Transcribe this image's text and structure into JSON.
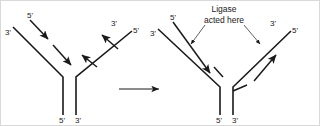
{
  "figure": {
    "background_color": "#ffffff",
    "stroke_color": "#1a1a1a",
    "border_color": "#d9d9d9"
  },
  "annotation": {
    "line1": "Ligase",
    "line2": "acted here"
  },
  "transition_arrow": {
    "direction": "right"
  },
  "left_panel": {
    "name": "before-ligation",
    "labels": {
      "top_left_outer": "3'",
      "top_left_inner": "5'",
      "top_right_inner": "3'",
      "top_right_outer": "5'",
      "stem_left": "5'",
      "stem_right": "3'"
    },
    "fragments": {
      "left_arm": 2,
      "right_arm": 2,
      "continuous": false
    }
  },
  "right_panel": {
    "name": "after-ligation",
    "labels": {
      "top_left_outer": "3'",
      "top_left_inner": "5'",
      "top_right_inner": "3'",
      "top_right_outer": "5'",
      "stem_left": "5'",
      "stem_right": "3'"
    },
    "fragments": {
      "left_arm": 1,
      "right_arm": 1,
      "continuous": true
    }
  }
}
